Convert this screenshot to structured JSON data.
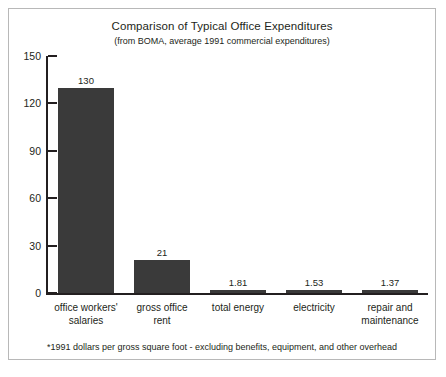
{
  "chart_data": {
    "type": "bar",
    "title": "Comparison of Typical Office Expenditures",
    "subtitle": "(from BOMA, average 1991 commercial expenditures)",
    "footnote": "*1991 dollars per gross square foot - excluding benefits, equipment, and other overhead",
    "xlabel": "",
    "ylabel": "",
    "ylim": [
      0,
      150
    ],
    "yticks": [
      0,
      30,
      60,
      90,
      120,
      150
    ],
    "grid": false,
    "legend": "none",
    "bar_color": "#3a3a3a",
    "axis_color": "#231f20",
    "categories": [
      "office workers' salaries",
      "gross office rent",
      "total energy",
      "electricity",
      "repair and maintenance"
    ],
    "category_lines": [
      [
        "office workers'",
        "salaries"
      ],
      [
        "gross office",
        "rent"
      ],
      [
        "total energy"
      ],
      [
        "electricity"
      ],
      [
        "repair and",
        "maintenance"
      ]
    ],
    "values": [
      130,
      21,
      1.81,
      1.53,
      1.37
    ],
    "value_labels": [
      "130",
      "21",
      "1.81",
      "1.53",
      "1.37"
    ]
  }
}
